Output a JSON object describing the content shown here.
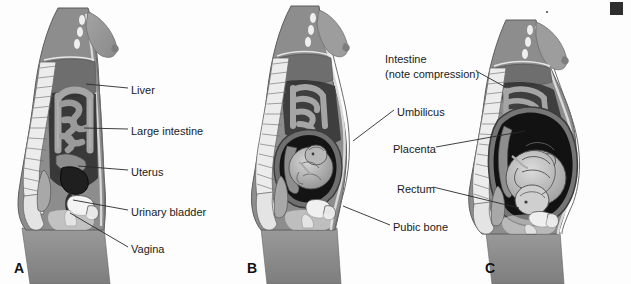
{
  "figure": {
    "background_color": "#fdfdfd",
    "line_color": "#2a2a2a",
    "text_color": "#1a1a1a"
  },
  "panels": [
    {
      "letter": "A",
      "caption": "Nonpregnant",
      "x": 14,
      "y": 268
    },
    {
      "letter": "B",
      "caption": "20 weeks",
      "x": 247,
      "y": 268
    },
    {
      "letter": "C",
      "caption": "30 weeks",
      "x": 485,
      "y": 268
    }
  ],
  "labels_a": [
    {
      "text": "Liver",
      "x": 131,
      "y": 91,
      "anchor_x": 86,
      "anchor_y": 84
    },
    {
      "text": "Large intestine",
      "x": 131,
      "y": 132,
      "anchor_x": 84,
      "anchor_y": 128
    },
    {
      "text": "Uterus",
      "x": 131,
      "y": 173,
      "anchor_x": 78,
      "anchor_y": 166
    },
    {
      "text": "Urinary bladder",
      "x": 131,
      "y": 213,
      "anchor_x": 73,
      "anchor_y": 200
    },
    {
      "text": "Vagina",
      "x": 131,
      "y": 250,
      "anchor_x": 70,
      "anchor_y": 213
    }
  ],
  "labels_center": [
    {
      "text": "Intestine",
      "x": 385,
      "y": 60,
      "target": "C"
    },
    {
      "text": "(note compression)",
      "x": 385,
      "y": 75,
      "target": "C",
      "anchor_x": 505,
      "anchor_y": 91
    },
    {
      "text": "Umbilicus",
      "x": 397,
      "y": 113,
      "target": "B",
      "anchor_x": 352,
      "anchor_y": 140
    },
    {
      "text": "Placenta",
      "x": 393,
      "y": 150,
      "target": "C",
      "anchor_x": 524,
      "anchor_y": 131
    },
    {
      "text": "Rectum",
      "x": 397,
      "y": 190,
      "target": "C",
      "anchor_x": 518,
      "anchor_y": 208
    },
    {
      "text": "Pubic bone",
      "x": 393,
      "y": 228,
      "target": "B",
      "anchor_x": 342,
      "anchor_y": 207
    }
  ],
  "colors": {
    "skin_outer": "#8e8e8e",
    "torso_fill": "#8a8a8a",
    "breast": "#969696",
    "liver": "#6e6e6e",
    "cavity_dark": "#5f5f5f",
    "intestine": "#9b9b9b",
    "bone_light": "#ececec",
    "spine_outline": "#6a6a6a",
    "uterus_dark": "#1f1f1f",
    "bladder": "#f2f2f2",
    "fetus": "#c9c9c9",
    "fetus_dark": "#3a3a3a",
    "placenta": "#808080",
    "thigh": "#909090",
    "amniotic": "#161616"
  }
}
